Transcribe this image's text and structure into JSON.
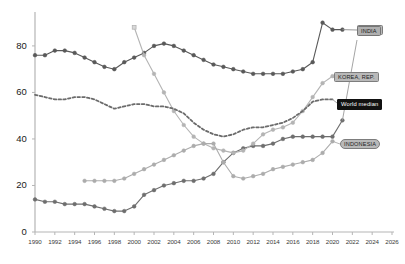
{
  "chart_data": {
    "type": "line",
    "title": "",
    "subtitle": "",
    "xlabel": "",
    "ylabel": "",
    "xlim": [
      1990,
      2026
    ],
    "ylim": [
      0,
      92
    ],
    "grid": false,
    "legend_position": "right-inline-callouts",
    "x_ticks": [
      1990,
      1992,
      1994,
      1996,
      1998,
      2000,
      2002,
      2004,
      2006,
      2008,
      2010,
      2012,
      2014,
      2016,
      2018,
      2020,
      2022,
      2024,
      2026
    ],
    "y_ticks": [
      0,
      20,
      40,
      60,
      80
    ],
    "series": [
      {
        "name": "CHINA",
        "color": "#595959",
        "style": "solid",
        "marker": "circle",
        "label_position": "top-right",
        "x": [
          1990,
          1991,
          1992,
          1993,
          1994,
          1995,
          1996,
          1997,
          1998,
          1999,
          2000,
          2001,
          2002,
          2003,
          2004,
          2005,
          2006,
          2007,
          2008,
          2009,
          2010,
          2011,
          2012,
          2013,
          2014,
          2015,
          2016,
          2017,
          2018,
          2019,
          2020,
          2021
        ],
        "values": [
          76,
          76,
          78,
          78,
          77,
          75,
          73,
          71,
          70,
          73,
          75,
          77,
          80,
          81,
          80,
          78,
          76,
          74,
          72,
          71,
          70,
          69,
          68,
          68,
          68,
          68,
          69,
          70,
          73,
          90,
          87,
          87
        ]
      },
      {
        "name": "INDIA",
        "color": "#6e6e6e",
        "style": "solid",
        "marker": "circle",
        "label_position": "top-right-second",
        "x": [
          1990,
          1991,
          1992,
          1993,
          1994,
          1995,
          1996,
          1997,
          1998,
          1999,
          2000,
          2001,
          2002,
          2003,
          2004,
          2005,
          2006,
          2007,
          2008,
          2009,
          2010,
          2011,
          2012,
          2013,
          2014,
          2015,
          2016,
          2017,
          2018,
          2019,
          2020,
          2021
        ],
        "values": [
          14,
          13,
          13,
          12,
          12,
          12,
          11,
          10,
          9,
          9,
          11,
          16,
          18,
          20,
          21,
          22,
          22,
          23,
          25,
          30,
          34,
          36,
          37,
          37,
          38,
          40,
          41,
          41,
          41,
          41,
          41,
          48
        ]
      },
      {
        "name": "KOREA, REP.",
        "color": "#b4b4b4",
        "style": "solid",
        "marker": "circle",
        "start_marker": "square",
        "label_position": "right-upper-mid",
        "x": [
          2000,
          2001,
          2002,
          2003,
          2004,
          2005,
          2006,
          2007,
          2008,
          2009,
          2010,
          2011,
          2012,
          2013,
          2014,
          2015,
          2016,
          2017,
          2018,
          2019,
          2020
        ],
        "values": [
          88,
          76,
          68,
          60,
          52,
          46,
          41,
          38,
          36,
          35,
          34,
          35,
          38,
          42,
          44,
          45,
          47,
          52,
          58,
          64,
          67
        ]
      },
      {
        "name": "INDONESIA",
        "color": "#acacac",
        "style": "solid",
        "marker": "circle",
        "label_position": "right-lower",
        "x": [
          1995,
          1996,
          1997,
          1998,
          1999,
          2000,
          2001,
          2002,
          2003,
          2004,
          2005,
          2006,
          2007,
          2008,
          2009,
          2010,
          2011,
          2012,
          2013,
          2014,
          2015,
          2016,
          2017,
          2018,
          2019,
          2020
        ],
        "values": [
          22,
          22,
          22,
          22,
          23,
          25,
          27,
          29,
          31,
          33,
          35,
          37,
          38,
          38,
          30,
          24,
          23,
          24,
          25,
          27,
          28,
          29,
          30,
          31,
          34,
          39
        ]
      },
      {
        "name": "World median",
        "color": "#6b6b6b",
        "style": "dashed",
        "marker": "none",
        "label_position": "right-mid",
        "x": [
          1990,
          1991,
          1992,
          1993,
          1994,
          1995,
          1996,
          1997,
          1998,
          1999,
          2000,
          2001,
          2002,
          2003,
          2004,
          2005,
          2006,
          2007,
          2008,
          2009,
          2010,
          2011,
          2012,
          2013,
          2014,
          2015,
          2016,
          2017,
          2018,
          2019,
          2020
        ],
        "values": [
          59,
          58,
          57,
          57,
          58,
          58,
          57,
          55,
          53,
          54,
          55,
          55,
          54,
          54,
          53,
          51,
          47,
          44,
          42,
          41,
          42,
          44,
          45,
          45,
          46,
          47,
          49,
          52,
          56,
          57,
          57
        ]
      }
    ],
    "annotations": [
      {
        "id": "china-callout",
        "text": "CHINA",
        "style": "grey-box"
      },
      {
        "id": "india-callout",
        "text": "INDIA",
        "style": "grey-box"
      },
      {
        "id": "korea-callout",
        "text": "KOREA, REP.",
        "style": "grey-box"
      },
      {
        "id": "world-median-callout",
        "text": "World median",
        "style": "dark-box"
      },
      {
        "id": "indonesia-callout",
        "text": "INDONESIA",
        "style": "grey-rounded-box"
      }
    ]
  },
  "axes": {
    "y_tick_labels": [
      "0",
      "20",
      "40",
      "60",
      "80"
    ],
    "x_tick_labels": [
      "1990",
      "1992",
      "1994",
      "1996",
      "1998",
      "2000",
      "2002",
      "2004",
      "2006",
      "2008",
      "2010",
      "2012",
      "2014",
      "2016",
      "2018",
      "2020",
      "2022",
      "2024",
      "2026"
    ]
  },
  "callouts": {
    "china": "CHINA",
    "india": "INDIA",
    "korea": "KOREA, REP.",
    "world_median": "World median",
    "indonesia": "INDONESIA"
  },
  "colors": {
    "china": "#595959",
    "india": "#6e6e6e",
    "korea": "#b4b4b4",
    "indonesia": "#acacac",
    "world_median": "#6b6b6b",
    "axis": "#b0b0b0",
    "background": "#ffffff"
  }
}
